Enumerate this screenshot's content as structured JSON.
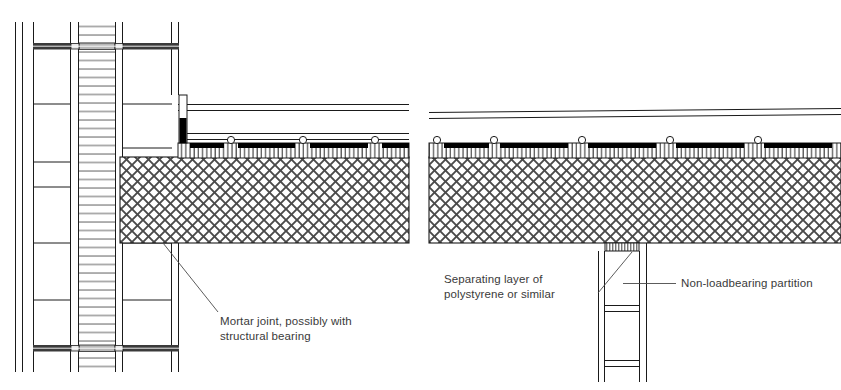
{
  "drawing": {
    "type": "architectural-section-detail",
    "subject": "Floor slab bearing details at external cavity wall and at non-loadbearing partition",
    "background_color": "#ffffff",
    "line_color": "#1a1a1a",
    "text_color": "#3a3a3a",
    "fill_black": "#000000",
    "hatch_color": "#555555"
  },
  "annotations": [
    {
      "id": "mortar-joint",
      "text": "Mortar joint, possibly with\nstructural bearing",
      "x": 220,
      "y": 314
    },
    {
      "id": "separating-layer",
      "text": "Separating layer of\npolystyrene or similar",
      "x": 444,
      "y": 272
    },
    {
      "id": "non-loadbearing-partition",
      "text": "Non-loadbearing partition",
      "x": 681,
      "y": 276
    }
  ],
  "details": {
    "left": {
      "name": "external-cavity-wall-detail",
      "layers": [
        "outer leaf",
        "cavity",
        "inner blockwork leaf",
        "insulation core with horizontal hatching",
        "mortar joint with wall ties"
      ],
      "slab": "in-situ concrete floor slab, crosshatched",
      "topping": "screed with vertical hatching, service ducts and edge insulation"
    },
    "right": {
      "name": "partition-bearing-detail",
      "layers": [
        "concrete floor slab, crosshatched",
        "screed with vertical hatching",
        "separating layer of polystyrene",
        "non-loadbearing blockwork partition"
      ]
    }
  }
}
